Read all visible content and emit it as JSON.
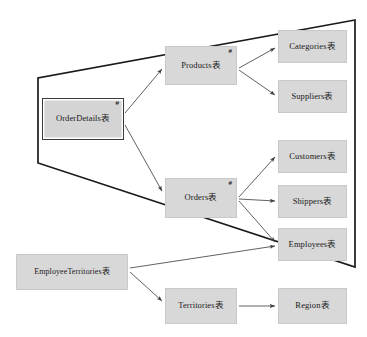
{
  "diagram": {
    "type": "entity-relationship-dependency-graph",
    "background_color": "#ffffff",
    "node_fill_color": "#d8d8d8",
    "node_border_color": "#c9c9c9",
    "emphasis_border_color": "#3a3a3a",
    "edge_color": "#444444",
    "group_outline_color": "#1a1a1a",
    "key_marker_symbol": "#",
    "nodes": [
      {
        "id": "orderdetails",
        "label": "OrderDetails表",
        "key_marker": "#",
        "emphasized": true,
        "x": 42,
        "y": 98,
        "w": 82,
        "h": 42
      },
      {
        "id": "products",
        "label": "Products表",
        "key_marker": "#",
        "emphasized": false,
        "x": 165,
        "y": 46,
        "w": 72,
        "h": 39
      },
      {
        "id": "orders",
        "label": "Orders表",
        "key_marker": "#",
        "emphasized": false,
        "x": 165,
        "y": 178,
        "w": 72,
        "h": 40
      },
      {
        "id": "categories",
        "label": "Categories表",
        "key_marker": "",
        "emphasized": false,
        "x": 278,
        "y": 30,
        "w": 69,
        "h": 33
      },
      {
        "id": "suppliers",
        "label": "Suppliers表",
        "key_marker": "",
        "emphasized": false,
        "x": 278,
        "y": 80,
        "w": 69,
        "h": 33
      },
      {
        "id": "customers",
        "label": "Customers表",
        "key_marker": "",
        "emphasized": false,
        "x": 278,
        "y": 140,
        "w": 69,
        "h": 33
      },
      {
        "id": "shippers",
        "label": "Shippers表",
        "key_marker": "",
        "emphasized": false,
        "x": 278,
        "y": 185,
        "w": 69,
        "h": 33
      },
      {
        "id": "employees",
        "label": "Employees表",
        "key_marker": "",
        "emphasized": false,
        "x": 278,
        "y": 228,
        "w": 69,
        "h": 33
      },
      {
        "id": "employeeterritories",
        "label": "EmployeeTerritories表",
        "key_marker": "",
        "emphasized": false,
        "x": 16,
        "y": 254,
        "w": 112,
        "h": 36
      },
      {
        "id": "territories",
        "label": "Territories表",
        "key_marker": "",
        "emphasized": false,
        "x": 165,
        "y": 288,
        "w": 72,
        "h": 36
      },
      {
        "id": "region",
        "label": "Region表",
        "key_marker": "",
        "emphasized": false,
        "x": 278,
        "y": 288,
        "w": 69,
        "h": 36
      }
    ],
    "edges": [
      {
        "from": "orderdetails",
        "to": "products",
        "x1": 125,
        "y1": 113,
        "x2": 163,
        "y2": 68
      },
      {
        "from": "orderdetails",
        "to": "orders",
        "x1": 125,
        "y1": 125,
        "x2": 163,
        "y2": 192
      },
      {
        "from": "products",
        "to": "categories",
        "x1": 239,
        "y1": 68,
        "x2": 276,
        "y2": 47
      },
      {
        "from": "products",
        "to": "suppliers",
        "x1": 239,
        "y1": 70,
        "x2": 276,
        "y2": 96
      },
      {
        "from": "orders",
        "to": "customers",
        "x1": 239,
        "y1": 197,
        "x2": 276,
        "y2": 156
      },
      {
        "from": "orders",
        "to": "shippers",
        "x1": 239,
        "y1": 199,
        "x2": 276,
        "y2": 201
      },
      {
        "from": "orders",
        "to": "employees",
        "x1": 239,
        "y1": 201,
        "x2": 276,
        "y2": 243
      },
      {
        "from": "employeeterritories",
        "to": "employees",
        "x1": 130,
        "y1": 268,
        "x2": 276,
        "y2": 246
      },
      {
        "from": "employeeterritories",
        "to": "territories",
        "x1": 130,
        "y1": 272,
        "x2": 163,
        "y2": 302
      },
      {
        "from": "territories",
        "to": "region",
        "x1": 239,
        "y1": 306,
        "x2": 276,
        "y2": 306
      }
    ],
    "group_outline": {
      "label": "strongly-connected-group",
      "points": "355,20 38,78 38,163 355,267 355,20"
    }
  }
}
